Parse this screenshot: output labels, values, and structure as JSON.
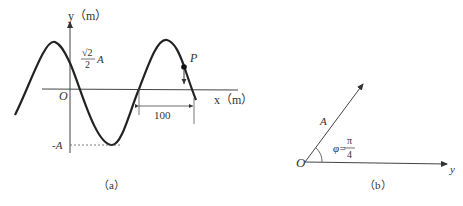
{
  "figure_a": {
    "caption": "（a）",
    "y_axis_label": "y（m）",
    "x_axis_label": "x（m）",
    "origin_label": "O",
    "amplitude_label": "A",
    "sqrt2_num": "√2",
    "sqrt2_den": "2",
    "neg_amplitude_label": "-A",
    "point_label": "P",
    "distance_label": "100"
  },
  "figure_b": {
    "caption": "（b）",
    "origin_label": "O",
    "vector_label": "A",
    "axis_label": "y",
    "angle_symbol": "φ=",
    "angle_num": "π",
    "angle_den": "4"
  }
}
